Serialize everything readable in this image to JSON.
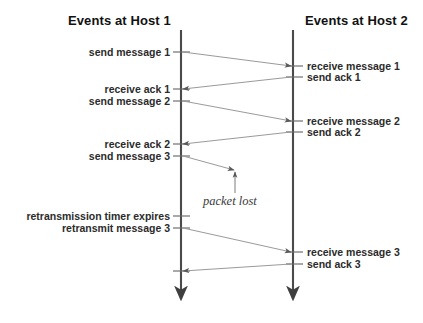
{
  "figure": {
    "kind": "sequence-diagram",
    "background_color": "#ffffff",
    "timeline_color": "#4a4a4a",
    "message_color": "#8c8c8c",
    "text_color": "#2b2b2b"
  },
  "headers": {
    "left": "Events at Host 1",
    "right": "Events at Host 2"
  },
  "left_events": [
    {
      "label": "send message 1"
    },
    {
      "label": "receive ack 1"
    },
    {
      "label": "send message 2"
    },
    {
      "label": "receive ack 2"
    },
    {
      "label": "send message 3"
    },
    {
      "label": "retransmission timer expires"
    },
    {
      "label": "retransmit message 3"
    }
  ],
  "right_events": [
    {
      "label": "receive message 1"
    },
    {
      "label": "send ack 1"
    },
    {
      "label": "receive message 2"
    },
    {
      "label": "send ack 2"
    },
    {
      "label": "receive message 3"
    },
    {
      "label": "send ack 3"
    }
  ],
  "annotations": [
    {
      "label": "packet lost"
    }
  ]
}
